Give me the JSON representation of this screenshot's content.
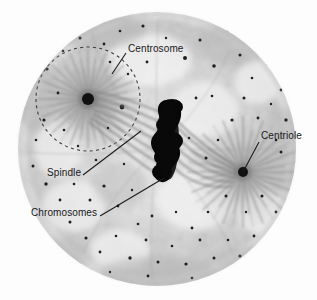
{
  "figure": {
    "kind": "light-micrograph",
    "frame_color": "#4a4a4a",
    "background_color": "#fefefe",
    "label_color": "#17171a",
    "leader_line_color": "#1b1b1b"
  },
  "annotations": [
    {
      "id": "centrosome",
      "label": "Centrosome",
      "icon": "leader-line-icon",
      "text_x": 128,
      "text_y": 43,
      "leader_from": [
        126,
        53
      ],
      "leader_to": [
        112,
        74
      ]
    },
    {
      "id": "centriole",
      "label": "Centriole",
      "icon": "leader-line-icon",
      "text_x": 261,
      "text_y": 130,
      "leader_from": [
        259,
        142
      ],
      "leader_to": [
        243,
        172
      ]
    },
    {
      "id": "spindle",
      "label": "Spindle",
      "icon": "leader-line-icon",
      "text_x": 47,
      "text_y": 167,
      "leader_from": [
        83,
        175
      ],
      "leader_to": [
        141,
        131
      ]
    },
    {
      "id": "chromosomes",
      "label": "Chromosomes",
      "icon": "leader-line-icon",
      "text_x": 31,
      "text_y": 207,
      "leader_from": [
        100,
        216
      ],
      "leader_to": [
        164,
        178
      ]
    }
  ],
  "structures": {
    "cell": {
      "name": "cell-body",
      "center": [
        157,
        149
      ],
      "radius_x": 139,
      "radius_y": 137,
      "fill": "#d8d8d8"
    },
    "centrosome_aster": {
      "name": "centrosome-aster",
      "center": [
        88,
        99
      ],
      "radius": 52,
      "dashed_outline": true,
      "dash_pattern": "3 3"
    },
    "left_centriole": {
      "name": "left-centriole-dot",
      "center": [
        88,
        99
      ],
      "radius": 6,
      "fill": "#111111"
    },
    "right_centriole": {
      "name": "right-centriole-dot",
      "center": [
        243,
        172
      ],
      "radius": 5,
      "fill": "#111111"
    },
    "right_aster": {
      "name": "right-aster",
      "center": [
        243,
        172
      ],
      "radius": 60
    },
    "chromosome_mass": {
      "name": "chromosome-mass",
      "fill": "#080808",
      "center": [
        168,
        140
      ]
    }
  }
}
